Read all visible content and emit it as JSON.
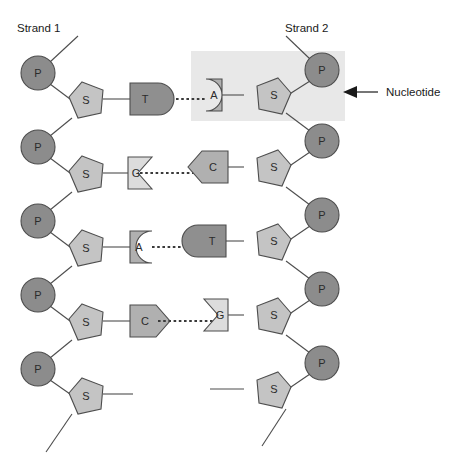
{
  "figure": {
    "title_left": "Strand 1",
    "title_right": "Strand 2",
    "callout_label": "Nucleotide",
    "phosphate_letter": "P",
    "sugar_letter": "S",
    "colors": {
      "phosphate_fill": "#8c8c8c",
      "sugar_fill": "#c4c4c4",
      "base_dark_fill": "#8f8f8f",
      "base_mid_fill": "#b0b0b0",
      "base_light_fill": "#dcdcdc",
      "outline": "#4d4d4d",
      "highlight_box": "#e8e8e8",
      "text": "#1a1a1a",
      "background": "#ffffff"
    },
    "base_pairs": [
      {
        "left_base": "T",
        "right_base": "A",
        "left_shape": "convex-right",
        "right_shape": "concave-left",
        "left_tone": "dark",
        "right_tone": "mid"
      },
      {
        "left_base": "G",
        "right_base": "C",
        "left_shape": "notch-right",
        "right_shape": "point-left",
        "left_tone": "light",
        "right_tone": "mid"
      },
      {
        "left_base": "A",
        "right_base": "T",
        "left_shape": "concave-right",
        "right_shape": "convex-left",
        "left_tone": "mid",
        "right_tone": "dark"
      },
      {
        "left_base": "C",
        "right_base": "G",
        "left_shape": "point-right",
        "right_shape": "notch-left",
        "left_tone": "mid",
        "right_tone": "light"
      }
    ],
    "strand1_phosphate_count": 5,
    "strand1_sugar_count": 5,
    "strand2_phosphate_count": 5,
    "strand2_sugar_count": 5
  }
}
